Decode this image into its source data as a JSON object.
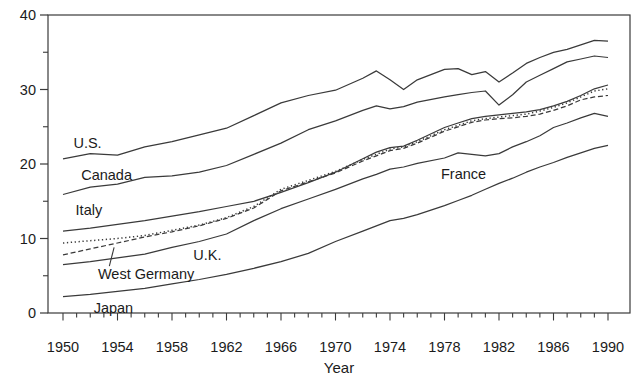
{
  "figure": {
    "background": "#ffffff",
    "ink_color": "#3a3a3a",
    "text_color": "#1b1b1b",
    "xlabel": "Year"
  },
  "chart_data": {
    "type": "line",
    "title": "",
    "xlabel": "Year",
    "ylabel": "",
    "xlim": [
      1948.9,
      1991.6
    ],
    "ylim": [
      0,
      40
    ],
    "y_ticks_major": [
      0,
      10,
      20,
      30,
      40
    ],
    "y_ticks_minor": [
      5,
      15,
      25,
      35
    ],
    "x_ticks_labeled": [
      1950,
      1954,
      1958,
      1962,
      1966,
      1970,
      1974,
      1978,
      1982,
      1986,
      1990
    ],
    "x_minor_tick_step_years": 1,
    "grid": "off",
    "legend_position": "inline-labels",
    "x": [
      1950,
      1952,
      1954,
      1956,
      1958,
      1960,
      1962,
      1964,
      1966,
      1968,
      1970,
      1972,
      1973,
      1974,
      1975,
      1976,
      1978,
      1979,
      1980,
      1981,
      1982,
      1983,
      1984,
      1985,
      1986,
      1987,
      1988,
      1989,
      1990
    ],
    "series": [
      {
        "name": "U.S.",
        "style": "solid",
        "values": [
          20.7,
          21.4,
          21.2,
          22.3,
          23.0,
          23.9,
          24.8,
          26.5,
          28.2,
          29.2,
          29.9,
          31.5,
          32.5,
          31.3,
          30.0,
          31.3,
          32.7,
          32.8,
          32.0,
          32.4,
          31.0,
          32.2,
          33.5,
          34.3,
          35.0,
          35.4,
          36.0,
          36.6,
          36.5
        ]
      },
      {
        "name": "Canada",
        "style": "solid",
        "values": [
          15.9,
          16.9,
          17.3,
          18.2,
          18.4,
          18.9,
          19.8,
          21.3,
          22.8,
          24.6,
          25.8,
          27.2,
          27.8,
          27.4,
          27.7,
          28.3,
          29.0,
          29.3,
          29.6,
          29.8,
          27.9,
          29.3,
          31.0,
          31.9,
          32.8,
          33.7,
          34.1,
          34.5,
          34.3
        ]
      },
      {
        "name": "Italy",
        "style": "solid",
        "values": [
          11.0,
          11.4,
          11.9,
          12.4,
          13.0,
          13.6,
          14.3,
          15.0,
          16.2,
          17.5,
          18.9,
          20.7,
          21.6,
          22.2,
          22.4,
          23.2,
          24.9,
          25.5,
          26.1,
          26.4,
          26.6,
          26.8,
          27.0,
          27.3,
          27.8,
          28.4,
          29.2,
          30.1,
          30.6
        ]
      },
      {
        "name": "France",
        "style": "dotted",
        "values": [
          9.4,
          9.7,
          10.0,
          10.4,
          11.1,
          11.8,
          12.8,
          14.3,
          16.6,
          17.8,
          19.0,
          20.6,
          21.3,
          22.0,
          22.3,
          23.0,
          24.6,
          25.2,
          25.8,
          26.1,
          26.3,
          26.5,
          26.7,
          27.1,
          27.6,
          28.2,
          29.0,
          29.8,
          30.1
        ]
      },
      {
        "name": "West Germany",
        "style": "dashed",
        "values": [
          7.8,
          8.6,
          9.4,
          10.2,
          10.9,
          11.7,
          12.7,
          14.1,
          16.4,
          17.6,
          18.8,
          20.4,
          21.1,
          21.8,
          22.1,
          22.8,
          24.4,
          25.0,
          25.6,
          25.9,
          26.1,
          26.2,
          26.4,
          26.7,
          27.2,
          27.8,
          28.6,
          29.0,
          29.2
        ]
      },
      {
        "name": "U.K.",
        "style": "solid",
        "values": [
          6.5,
          6.9,
          7.4,
          7.9,
          8.8,
          9.6,
          10.6,
          12.4,
          14.0,
          15.3,
          16.6,
          18.0,
          18.6,
          19.3,
          19.6,
          20.1,
          20.8,
          21.5,
          21.3,
          21.1,
          21.4,
          22.3,
          23.0,
          23.8,
          24.9,
          25.5,
          26.2,
          26.8,
          26.4
        ]
      },
      {
        "name": "Japan",
        "style": "solid",
        "values": [
          2.2,
          2.5,
          2.9,
          3.3,
          3.9,
          4.5,
          5.2,
          6.0,
          6.9,
          8.0,
          9.6,
          11.0,
          11.7,
          12.4,
          12.7,
          13.2,
          14.4,
          15.1,
          15.8,
          16.6,
          17.4,
          18.1,
          18.9,
          19.6,
          20.2,
          20.9,
          21.5,
          22.1,
          22.5
        ]
      }
    ],
    "annotations": [
      {
        "text": "U.S.",
        "year": 1951.8,
        "value": 22.7
      },
      {
        "text": "Canada",
        "year": 1953.2,
        "value": 18.4
      },
      {
        "text": "Italy",
        "year": 1951.9,
        "value": 13.7
      },
      {
        "text": "U.K.",
        "year": 1960.6,
        "value": 7.6
      },
      {
        "text": "West Germany",
        "year": 1956.1,
        "value": 5.05
      },
      {
        "text": "Japan",
        "year": 1953.7,
        "value": 0.55
      },
      {
        "text": "France",
        "year": 1979.4,
        "value": 18.5
      }
    ],
    "pointer_line": {
      "for": "West Germany",
      "from_year": 1953.4,
      "from_value": 6.3,
      "to_year": 1953.75,
      "to_value": 8.8
    }
  }
}
